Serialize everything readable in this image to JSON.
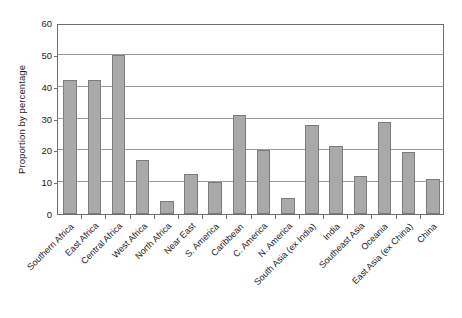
{
  "chart_data": {
    "type": "bar",
    "title": "",
    "xlabel": "",
    "ylabel": "Proportion by percentage",
    "ylim": [
      0,
      60
    ],
    "yticks": [
      0,
      10,
      20,
      30,
      40,
      50,
      60
    ],
    "grid": true,
    "legend": false,
    "legend_position": "none",
    "bar_color": "#a9a9a9",
    "bar_edge_color": "#7d7d7d",
    "axis_color": "#6e6e6e",
    "gridline_color": "#9a9a9a",
    "background": "#ffffff",
    "categories": [
      "Southern Africa",
      "East Africa",
      "Central Africa",
      "West Africa",
      "North Africa",
      "Near East",
      "S. America",
      "Caribbean",
      "C. America",
      "N. America",
      "South Asia (ex India)",
      "India",
      "Southeast Asia",
      "Oceania",
      "East Asia (ex China)",
      "China"
    ],
    "values": [
      42,
      42,
      50,
      17,
      4,
      12.5,
      10,
      31,
      20,
      5,
      28,
      21.5,
      12,
      29,
      19.5,
      11
    ]
  },
  "axis": {
    "y_tick_labels": [
      "0",
      "10",
      "20",
      "30",
      "40",
      "50",
      "60"
    ],
    "y_title": "Proportion by percentage"
  }
}
